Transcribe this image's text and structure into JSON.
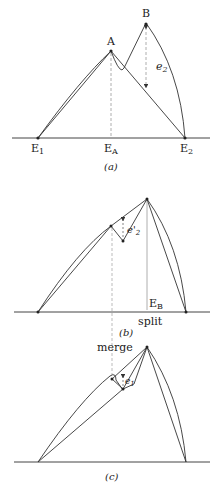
{
  "panels": {
    "a": {
      "caption": "(a)",
      "point_A": "A",
      "point_B": "B",
      "error_label": "e",
      "error_sub": "2",
      "axis_labels": {
        "E1": "E",
        "E1_sub": "1",
        "EA": "E",
        "EA_sub": "A",
        "E2": "E",
        "E2_sub": "2"
      }
    },
    "b": {
      "caption": "(b)",
      "error_label": "e'",
      "error_sub": "2",
      "axis_label": "E",
      "axis_label_sub": "B",
      "action": "split"
    },
    "c": {
      "caption": "(c)",
      "error_label": "e",
      "error_sub": "1",
      "action": "merge"
    }
  },
  "colors": {
    "line": "#333333",
    "dashed": "#999999",
    "point": "#222222"
  }
}
